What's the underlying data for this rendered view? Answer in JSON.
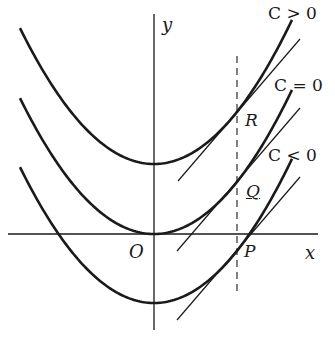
{
  "figure": {
    "axes": {
      "x_label": "x",
      "y_label": "y",
      "origin_label": "O"
    },
    "curves": [
      {
        "label": "C > 0",
        "point_label": "R"
      },
      {
        "label": "C = 0",
        "point_label": "Q"
      },
      {
        "label": "C < 0",
        "point_label": "P"
      }
    ],
    "colors": {
      "stroke": "#1a1a1a",
      "background": "#ffffff"
    }
  }
}
